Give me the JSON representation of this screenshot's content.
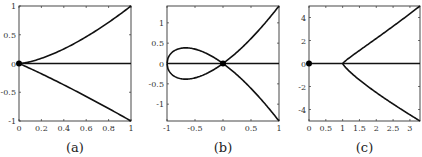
{
  "chart_data": [
    {
      "type": "line",
      "panel": "a",
      "caption": "(a)",
      "xlim": [
        0,
        1
      ],
      "ylim": [
        -1,
        1
      ],
      "xticks": [
        0,
        0.2,
        0.4,
        0.6,
        0.8,
        1
      ],
      "xtick_labels": [
        "0",
        "0.2",
        "0.4",
        "0.6",
        "0.8",
        "1"
      ],
      "yticks": [
        1,
        0.5,
        0,
        -0.5,
        -1
      ],
      "ytick_labels": [
        "1",
        "0.5",
        "0",
        "-0.5",
        "-1"
      ],
      "grid": false,
      "series": [
        {
          "name": "upper branch",
          "x": [
            0,
            0.2,
            0.4,
            0.6,
            0.8,
            1
          ],
          "y": [
            0,
            0.09,
            0.25,
            0.46,
            0.72,
            1
          ]
        },
        {
          "name": "lower branch",
          "x": [
            0,
            0.2,
            0.4,
            0.6,
            0.8,
            1
          ],
          "y": [
            0,
            -0.17,
            -0.36,
            -0.57,
            -0.78,
            -1
          ]
        },
        {
          "name": "axis line",
          "x": [
            0,
            1
          ],
          "y": [
            0,
            0
          ]
        }
      ],
      "markers": [
        {
          "x": 0,
          "y": 0
        }
      ]
    },
    {
      "type": "line",
      "panel": "b",
      "caption": "(b)",
      "xlim": [
        -1,
        1
      ],
      "ylim": [
        -1.414,
        1.414
      ],
      "xticks": [
        -1,
        -0.5,
        0,
        0.5,
        1
      ],
      "xtick_labels": [
        "-1",
        "-0.5",
        "0",
        "0.5",
        "1"
      ],
      "yticks": [
        1,
        0.5,
        0,
        -0.5,
        -1
      ],
      "ytick_labels": [
        "1",
        "0.5",
        "0",
        "-0.5",
        "-1"
      ],
      "grid": false,
      "series": [
        {
          "name": "nodal cubic y^2 = x^2(x+1)",
          "x": [
            -1,
            -0.9,
            -0.67,
            -0.4,
            0,
            0.5,
            1
          ],
          "y": [
            0,
            0.28,
            0.385,
            0.31,
            0,
            0.61,
            1.414
          ]
        },
        {
          "name": "mirror branch",
          "x": [
            -1,
            -0.9,
            -0.67,
            -0.4,
            0,
            0.5,
            1
          ],
          "y": [
            0,
            -0.28,
            -0.385,
            -0.31,
            0,
            -0.61,
            -1.414
          ]
        },
        {
          "name": "axis line",
          "x": [
            -1,
            1
          ],
          "y": [
            0,
            0
          ]
        }
      ],
      "markers": [
        {
          "x": 0,
          "y": 0
        }
      ]
    },
    {
      "type": "line",
      "panel": "c",
      "caption": "(c)",
      "xlim": [
        0,
        3.3
      ],
      "ylim": [
        -5,
        5
      ],
      "xticks": [
        0,
        0.5,
        1,
        1.5,
        2,
        2.5,
        3
      ],
      "xtick_labels": [
        "0",
        "0.5",
        "1",
        "1.5",
        "2",
        "2.5",
        "3"
      ],
      "yticks": [
        4,
        2,
        0,
        -2,
        -4
      ],
      "ytick_labels": [
        "4",
        "2",
        "0",
        "-2",
        "-4"
      ],
      "grid": false,
      "series": [
        {
          "name": "upper branch",
          "x": [
            1,
            1.1,
            1.5,
            2,
            2.5,
            3,
            3.3
          ],
          "y": [
            0,
            0.45,
            1.3,
            2.2,
            3.2,
            4.3,
            5
          ]
        },
        {
          "name": "lower branch",
          "x": [
            1,
            1.1,
            1.5,
            2,
            2.5,
            3,
            3.3
          ],
          "y": [
            0,
            -0.45,
            -1.4,
            -2.5,
            -3.6,
            -4.5,
            -5
          ]
        },
        {
          "name": "axis line",
          "x": [
            0,
            3.3
          ],
          "y": [
            0,
            0
          ]
        }
      ],
      "markers": [
        {
          "x": 0,
          "y": 0
        }
      ]
    }
  ]
}
